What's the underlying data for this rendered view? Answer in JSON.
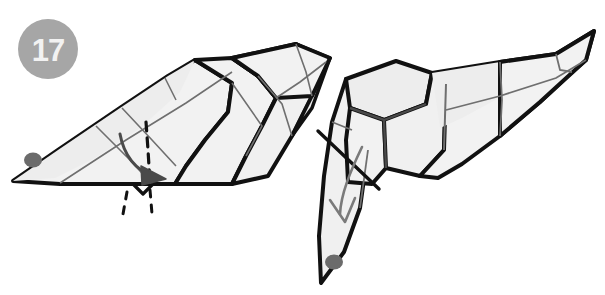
{
  "diagram": {
    "type": "origami-instruction",
    "step_number": "17",
    "background_color": "#ffffff",
    "badge": {
      "label": "17",
      "fill_color": "#a6a6a6",
      "text_color": "#f2f2f2",
      "center_x": 48,
      "center_y": 49,
      "radius": 30
    },
    "palette": {
      "outline": "#111111",
      "paper_light": "#f2f2f2",
      "paper_shade": "#e6e6e6",
      "crease_line": "#6f6f6f",
      "eye_dot": "#6b6b6b",
      "arrow_solid": "#4a4a4a",
      "arrow_hollow": "#7a7a7a",
      "dashed_fold": "#111111"
    },
    "figures": [
      {
        "name": "left-figure",
        "description": "Folded paper form pointing left with eye dot at tip, segmented body rising to the upper right, valley fold marked by dashed line and curved arrow",
        "eye": {
          "cx": 33,
          "cy": 160,
          "rx": 9,
          "ry": 7
        },
        "fold_marker": "dashed-vertical",
        "arrow": "curved-down-right-solid"
      },
      {
        "name": "right-figure",
        "description": "Result view with head flap folded down into a box-like neck, pointed body extending to the upper right, eye dot on the downward flap, reference crease crossing the neck and a hollow curved arrow",
        "eye": {
          "cx": 334,
          "cy": 262,
          "rx": 9,
          "ry": 7
        },
        "fold_marker": "straight-crossing-line",
        "arrow": "curved-down-hollow"
      }
    ]
  }
}
